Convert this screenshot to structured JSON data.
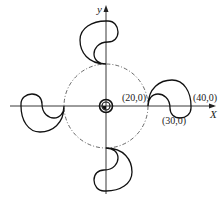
{
  "diagram": {
    "axes": {
      "x_label": "X",
      "y_label": "y"
    },
    "points": [
      {
        "label": "(20,0)",
        "x": 20,
        "y": 0
      },
      {
        "label": "(40,0)",
        "x": 40,
        "y": 0
      },
      {
        "label": "(30,0)",
        "x": 30,
        "y": 0
      }
    ],
    "base_circle": {
      "radius": 20,
      "style": "dash-dot"
    },
    "lobes": 4,
    "hub": "concentric-circles"
  }
}
